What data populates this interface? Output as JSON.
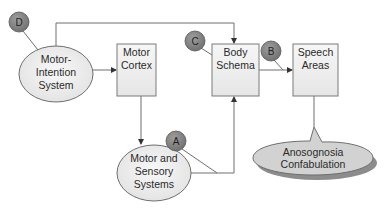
{
  "diagram": {
    "nodes": {
      "motor_intention": {
        "lines": [
          "Motor-",
          "Intention",
          "System"
        ],
        "shape": "ellipse"
      },
      "motor_cortex": {
        "lines": [
          "Motor",
          "Cortex"
        ],
        "shape": "box"
      },
      "body_schema": {
        "lines": [
          "Body",
          "Schema"
        ],
        "shape": "box"
      },
      "speech_areas": {
        "lines": [
          "Speech",
          "Areas"
        ],
        "shape": "box"
      },
      "motor_sensory": {
        "lines": [
          "Motor and",
          "Sensory",
          "Systems"
        ],
        "shape": "ellipse"
      },
      "anosognosia": {
        "lines": [
          "Anosognosia",
          "Confabulation"
        ],
        "shape": "callout"
      }
    },
    "markers": {
      "A": {
        "label": "A"
      },
      "B": {
        "label": "B"
      },
      "C": {
        "label": "C"
      },
      "D": {
        "label": "D"
      }
    },
    "edges": [
      {
        "from": "Motor-Intention System",
        "to": "Motor Cortex"
      },
      {
        "from": "Motor-Intention System",
        "to": "Body Schema"
      },
      {
        "from": "Motor Cortex",
        "to": "Motor and Sensory Systems"
      },
      {
        "from": "Motor and Sensory Systems",
        "to": "Body Schema"
      },
      {
        "from": "Body Schema",
        "to": "Speech Areas"
      },
      {
        "from": "Speech Areas",
        "to": "Anosognosia Confabulation"
      }
    ],
    "colors": {
      "marker_fill": "#8a8a8a",
      "node_fill": "#f2f2f2",
      "callout_fill": "#d4d4d4",
      "stroke": "#6e6e6e"
    }
  }
}
